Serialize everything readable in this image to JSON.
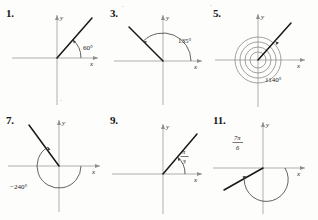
{
  "page": {
    "background_color": "#fdfdfc",
    "ink_color": "#181818",
    "axis_color": "#8e8e8e"
  },
  "axis": {
    "x_label": "x",
    "y_label": "y"
  },
  "figures": [
    {
      "number": "1.",
      "angle_label": "60°",
      "label_type": "degrees",
      "measure_deg": 60,
      "direction": "counterclockwise",
      "revolutions": 0,
      "terminal_quadrant": "I",
      "ray_angle_deg": 60
    },
    {
      "number": "3.",
      "angle_label": "135°",
      "label_type": "degrees",
      "measure_deg": 135,
      "direction": "counterclockwise",
      "revolutions": 0,
      "terminal_quadrant": "II",
      "ray_angle_deg": 135
    },
    {
      "number": "5.",
      "angle_label": "1140°",
      "label_type": "degrees",
      "measure_deg": 1140,
      "direction": "counterclockwise",
      "revolutions": 3,
      "terminal_quadrant": "I",
      "ray_angle_deg": 60
    },
    {
      "number": "7.",
      "angle_label": "−240°",
      "label_type": "degrees",
      "measure_deg": -240,
      "direction": "clockwise",
      "revolutions": 0,
      "terminal_quadrant": "II",
      "ray_angle_deg": 120
    },
    {
      "number": "9.",
      "angle_label_numerator": "π",
      "angle_label_denominator": "3",
      "label_type": "fraction",
      "measure_deg": 60,
      "direction": "counterclockwise",
      "revolutions": 0,
      "terminal_quadrant": "I",
      "ray_angle_deg": 60
    },
    {
      "number": "11.",
      "angle_label_numerator": "7π",
      "angle_label_denominator": "6",
      "label_type": "fraction",
      "measure_deg": 210,
      "direction": "counterclockwise",
      "revolutions": 0,
      "terminal_quadrant": "III",
      "ray_angle_deg": 210
    }
  ]
}
